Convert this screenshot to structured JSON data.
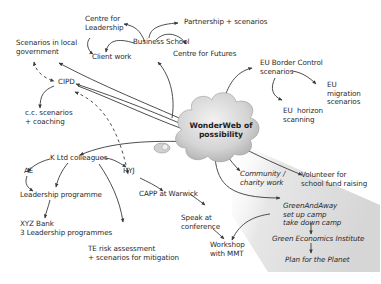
{
  "diagram": {
    "center": {
      "label": "WonderWeb of\npossibility"
    },
    "nodes": {
      "centre_leadership": "Centre for\nLeadership",
      "business_school": "Business School",
      "partnership": "Partnership + scenarios",
      "client_work": "Client work",
      "centre_futures": "Centre for Futures",
      "scenarios_local_gov": "Scenarios in local\ngovernment",
      "cipd": "CIPD",
      "cc_scenarios": "c.c. scenarios\n+ coaching",
      "eu_border": "EU Border Control\nscenarios",
      "eu_migration": "EU\nmigration\nscenarios",
      "eu_horizon": "EU  horizon\nscanning",
      "k_ltd": "K Ltd colleagues",
      "ae": "AE",
      "hyj": "HYJ",
      "leadership_prog": "Leadership programme",
      "xyz_bank": "XYZ Bank\n3 Leadership programmes",
      "capp": "CAPP at Warwick",
      "speak": "Speak at\nconference",
      "workshop": "Workshop\nwith MMT",
      "te_risk": "TE risk assessment\n+ scenarios for mitigation",
      "community": "Community /\ncharity work",
      "volunteer": "Volunteer for\nschool fund raising",
      "greenandaway": "GreenAndAway\nset up camp\ntake down camp",
      "green_econ": "Green Economics Institute",
      "plan_planet": "Plan for the Planet"
    },
    "colors": {
      "line": "#3a3a3a",
      "text": "#2a2a2a",
      "cloud": "#d8d8d8",
      "shade": "#e4e4e4"
    }
  }
}
